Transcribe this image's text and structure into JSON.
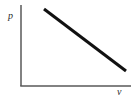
{
  "figure": {
    "background_color": "#ffffff",
    "width": 137,
    "height": 101
  },
  "axes": {
    "y_label": "p",
    "x_label": "v",
    "axis_color": "#585858",
    "axis_width": 1.5,
    "origin": {
      "x": 21,
      "y": 86
    },
    "y_axis_top": {
      "x": 21,
      "y": 5
    },
    "x_axis_right": {
      "x": 131,
      "y": 86
    },
    "ticks": [],
    "grid": false
  },
  "chart_data": {
    "type": "line",
    "title": "",
    "xlabel": "v",
    "ylabel": "p",
    "xlim": [
      0,
      1
    ],
    "ylim": [
      0,
      1
    ],
    "grid": false,
    "legend": false,
    "series": [
      {
        "name": "p-v line",
        "color": "#111111",
        "line_width": 3,
        "x": [
          0.209,
          1.0
        ],
        "y": [
          0.951,
          0.185
        ],
        "pixel_points": [
          {
            "x": 44,
            "y": 9
          },
          {
            "x": 126,
            "y": 71
          }
        ],
        "description": "straight line of negative slope"
      }
    ]
  }
}
